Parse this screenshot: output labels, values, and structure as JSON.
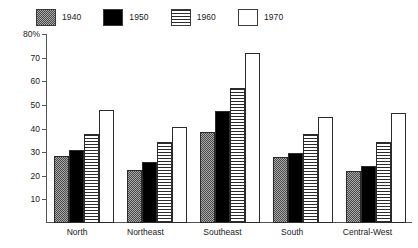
{
  "chart_data": {
    "type": "bar",
    "title": "",
    "subtitle": "",
    "xlabel": "",
    "ylabel": "",
    "ylim": [
      0,
      80
    ],
    "y_unit": "%",
    "grid": false,
    "legend_position": "top-left",
    "orientation": "vertical",
    "categories": [
      "North",
      "Northeast",
      "Southeast",
      "South",
      "Central-West"
    ],
    "y_ticks": [
      {
        "value": 80,
        "label": "80%"
      },
      {
        "value": 70,
        "label": "70"
      },
      {
        "value": 60,
        "label": "60"
      },
      {
        "value": 50,
        "label": "50"
      },
      {
        "value": 40,
        "label": "40"
      },
      {
        "value": 30,
        "label": "30"
      },
      {
        "value": 20,
        "label": "20"
      },
      {
        "value": 10,
        "label": "10"
      }
    ],
    "series": [
      {
        "name": "1940",
        "pattern": "dotted-gray",
        "color": "#a8a8a8",
        "values": [
          28.5,
          22.5,
          38.5,
          28.0,
          22.0
        ]
      },
      {
        "name": "1950",
        "pattern": "solid-black",
        "color": "#000000",
        "values": [
          31.0,
          26.0,
          47.5,
          29.5,
          24.0
        ]
      },
      {
        "name": "1960",
        "pattern": "horizontal-stripes",
        "color": "#2b2b2b",
        "values": [
          37.5,
          34.5,
          57.0,
          37.5,
          34.5
        ]
      },
      {
        "name": "1970",
        "pattern": "white-outline",
        "color": "#ffffff",
        "values": [
          48.0,
          40.5,
          72.0,
          45.0,
          46.5
        ]
      }
    ]
  },
  "legend": {
    "entries": [
      {
        "label": "1940"
      },
      {
        "label": "1950"
      },
      {
        "label": "1960"
      },
      {
        "label": "1970"
      }
    ]
  },
  "axis": {
    "line_color": "#555555"
  }
}
